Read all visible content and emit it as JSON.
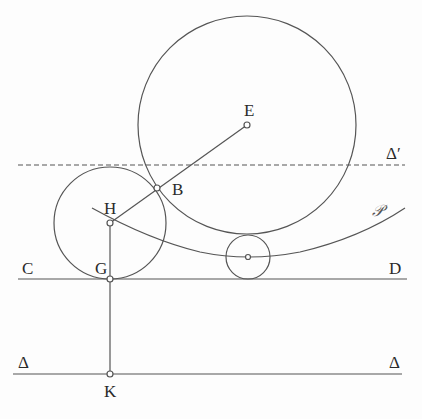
{
  "figure": {
    "type": "geometry-diagram",
    "stroke_color": "#555555",
    "point_fill": "#ffffff",
    "labels": {
      "E": "E",
      "B": "B",
      "H": "H",
      "G": "G",
      "C": "C",
      "D": "D",
      "K": "K",
      "delta_left": "Δ",
      "delta_right": "Δ",
      "delta_prime": "Δ′",
      "parabola": "𝒫"
    },
    "lines": {
      "delta_prime": {
        "y": 165,
        "x1": 18,
        "x2": 405,
        "style": "dashed"
      },
      "CD": {
        "y": 279,
        "x1": 18,
        "x2": 407,
        "style": "solid"
      },
      "delta": {
        "y": 374,
        "x1": 13,
        "x2": 402,
        "style": "solid"
      }
    },
    "circles": {
      "large": {
        "cx": 247,
        "cy": 125,
        "r": 109
      },
      "left": {
        "cx": 110,
        "cy": 223,
        "r": 56
      },
      "small": {
        "cx": 248,
        "cy": 257,
        "r": 22
      }
    },
    "points": {
      "E": {
        "x": 247,
        "y": 125
      },
      "B": {
        "x": 157,
        "y": 188
      },
      "H": {
        "x": 110,
        "y": 223
      },
      "G": {
        "x": 110,
        "y": 279
      },
      "K": {
        "x": 110,
        "y": 374
      },
      "small_center": {
        "x": 248,
        "y": 257
      }
    }
  }
}
